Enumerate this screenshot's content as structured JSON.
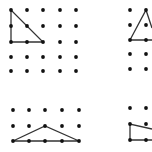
{
  "diagram": {
    "colors": {
      "background": "#ffffff",
      "dot": "#111111",
      "line": "#333333"
    },
    "panels": [
      {
        "id": "top-left",
        "dots_x": [
          11,
          27,
          43,
          60,
          76
        ],
        "dots_y": [
          10,
          26,
          42,
          57,
          71
        ],
        "shape": [
          [
            11,
            10
          ],
          [
            11,
            42
          ],
          [
            43,
            42
          ]
        ],
        "closed": true
      },
      {
        "id": "top-right",
        "dots_x": [
          130,
          146
        ],
        "dots_y": [
          10,
          25,
          40,
          54,
          69
        ],
        "shape": [
          [
            152,
            28
          ],
          [
            146,
            10
          ],
          [
            130,
            40
          ],
          [
            152,
            40
          ]
        ],
        "closed": false
      },
      {
        "id": "bottom-left",
        "dots_x": [
          13,
          29,
          45,
          62,
          79
        ],
        "dots_y": [
          110,
          126,
          141
        ],
        "shape": [
          [
            13,
            141
          ],
          [
            45,
            126
          ],
          [
            79,
            141
          ]
        ],
        "closed": true
      },
      {
        "id": "bottom-right",
        "dots_x": [
          130,
          146
        ],
        "dots_y": [
          108,
          124,
          140
        ],
        "shape": [
          [
            152,
            129
          ],
          [
            130,
            124
          ],
          [
            130,
            140
          ],
          [
            152,
            140
          ]
        ],
        "closed": false
      }
    ]
  }
}
